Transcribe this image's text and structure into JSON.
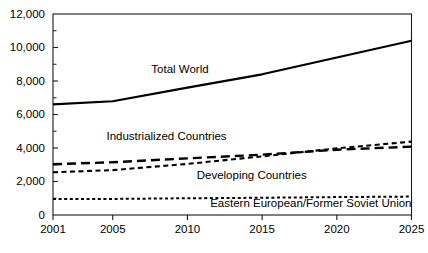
{
  "chart_data": {
    "type": "line",
    "title": "",
    "subtitle": "",
    "xlabel": "",
    "ylabel": "",
    "xlim": [
      2001,
      2025
    ],
    "ylim": [
      0,
      12000
    ],
    "grid": false,
    "legend_position": "inline-annotations",
    "x_ticks": [
      2001,
      2005,
      2010,
      2015,
      2020,
      2025
    ],
    "x_tick_labels": [
      "2001",
      "2005",
      "2010",
      "2015",
      "2020",
      "2025"
    ],
    "y_ticks": [
      0,
      2000,
      4000,
      6000,
      8000,
      10000,
      12000
    ],
    "y_tick_labels": [
      "0",
      "2,000",
      "4,000",
      "6,000",
      "8,000",
      "10,000",
      "12,000"
    ],
    "y_minor_ticks": [
      1000,
      3000,
      5000,
      7000,
      9000,
      11000
    ],
    "x": [
      2001,
      2005,
      2010,
      2015,
      2020,
      2025
    ],
    "series": [
      {
        "name": "Total World",
        "style": "solid",
        "values": [
          6600,
          6790,
          7600,
          8400,
          9400,
          10400
        ],
        "label_text": "Total World",
        "label_x": 2009.5,
        "label_y": 8450
      },
      {
        "name": "Industrialized Countries",
        "style": "long-dash",
        "values": [
          3030,
          3150,
          3380,
          3600,
          3900,
          4080
        ],
        "label_text": "Industrialized Countries",
        "label_x": 2008.6,
        "label_y": 4450
      },
      {
        "name": "Developing Countries",
        "style": "short-dash",
        "values": [
          2550,
          2680,
          3050,
          3500,
          3980,
          4380
        ],
        "label_text": "Developing Countries",
        "label_x": 2014.3,
        "label_y": 2150
      },
      {
        "name": "Eastern European/Former Soviet Union",
        "style": "dotted-dash",
        "values": [
          950,
          960,
          1000,
          1030,
          1070,
          1100
        ],
        "label_text": "Eastern European/Former Soviet Union",
        "label_x": 2025,
        "label_y": 460
      }
    ]
  }
}
